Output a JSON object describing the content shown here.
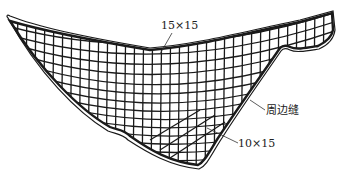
{
  "diagram": {
    "title": "",
    "labels": {
      "top_grid": "15×15",
      "perimeter_seam": "周边缝",
      "bottom_grid": "10×15"
    },
    "colors": {
      "line": "#1a1a1a",
      "background": "#ffffff"
    }
  }
}
